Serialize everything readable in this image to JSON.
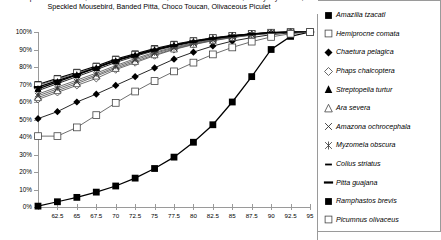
{
  "chart_data": {
    "type": "line",
    "title": "European Turtle-Dove, Chestnut-fronted Macaw, Yellow-crowned Parrot, Ebony Myzomela,\nSpeckled Mousebird, Banded Pitta, Choco Toucan, Olivaceous Piculet",
    "xlabel": "",
    "ylabel": "",
    "xlim": [
      60,
      95
    ],
    "ylim": [
      0,
      1
    ],
    "grid": false,
    "legend_position": "right",
    "x": [
      60,
      62.5,
      65,
      67.5,
      70,
      72.5,
      75,
      77.5,
      80,
      82.5,
      85,
      87.5,
      90,
      92.5,
      95
    ],
    "xtick_labels": [
      "62.5",
      "65",
      "67.5",
      "70",
      "72.5",
      "75",
      "77.5",
      "80",
      "82.5",
      "85",
      "87.5",
      "90",
      "92.5",
      "95"
    ],
    "xtick_values": [
      62.5,
      65,
      67.5,
      70,
      72.5,
      75,
      77.5,
      80,
      82.5,
      85,
      87.5,
      90,
      92.5,
      95
    ],
    "ytick_labels": [
      "0%",
      "10%",
      "20%",
      "30%",
      "40%",
      "50%",
      "60%",
      "70%",
      "80%",
      "90%",
      "100%"
    ],
    "ytick_values": [
      0,
      0.1,
      0.2,
      0.3,
      0.4,
      0.5,
      0.6,
      0.7,
      0.8,
      0.9,
      1.0
    ],
    "series": [
      {
        "name": "Amazilia tzacatl",
        "marker": "filled-square",
        "color": "#000000",
        "values": [
          0.7,
          0.735,
          0.77,
          0.805,
          0.845,
          0.875,
          0.905,
          0.93,
          0.95,
          0.967,
          0.98,
          0.99,
          0.997,
          1.0,
          1.0
        ]
      },
      {
        "name": "Hemiprocne comata",
        "marker": "open-square",
        "color": "#555555",
        "values": [
          0.695,
          0.73,
          0.765,
          0.8,
          0.84,
          0.87,
          0.9,
          0.925,
          0.947,
          0.965,
          0.978,
          0.989,
          0.996,
          1.0,
          1.0
        ]
      },
      {
        "name": "Chaetura pelagica",
        "marker": "filled-diamond",
        "color": "#000000",
        "values": [
          0.505,
          0.545,
          0.6,
          0.645,
          0.695,
          0.745,
          0.795,
          0.845,
          0.885,
          0.92,
          0.948,
          0.968,
          0.985,
          0.995,
          1.0
        ]
      },
      {
        "name": "Phaps chalcoptera",
        "marker": "open-diamond",
        "color": "#555555",
        "values": [
          0.615,
          0.655,
          0.695,
          0.735,
          0.785,
          0.825,
          0.865,
          0.9,
          0.928,
          0.95,
          0.968,
          0.982,
          0.992,
          0.998,
          1.0
        ]
      },
      {
        "name": "Streptopelia turtur",
        "marker": "filled-triangle",
        "color": "#000000",
        "values": [
          0.675,
          0.715,
          0.755,
          0.795,
          0.835,
          0.868,
          0.898,
          0.925,
          0.946,
          0.964,
          0.978,
          0.989,
          0.996,
          1.0,
          1.0
        ]
      },
      {
        "name": "Ara severa",
        "marker": "open-triangle",
        "color": "#555555",
        "values": [
          0.625,
          0.665,
          0.705,
          0.748,
          0.792,
          0.832,
          0.87,
          0.903,
          0.93,
          0.952,
          0.969,
          0.983,
          0.993,
          0.999,
          1.0
        ]
      },
      {
        "name": "Amazona ochrocephala",
        "marker": "cross-x",
        "color": "#555555",
        "values": [
          0.635,
          0.675,
          0.715,
          0.755,
          0.8,
          0.84,
          0.878,
          0.908,
          0.934,
          0.954,
          0.971,
          0.984,
          0.994,
          0.999,
          1.0
        ]
      },
      {
        "name": "Myzomela obscura",
        "marker": "asterisk",
        "color": "#555555",
        "values": [
          0.645,
          0.685,
          0.725,
          0.765,
          0.808,
          0.848,
          0.884,
          0.913,
          0.938,
          0.957,
          0.973,
          0.985,
          0.994,
          0.999,
          1.0
        ]
      },
      {
        "name": "Colius striatus",
        "marker": "short-dash",
        "color": "#000000",
        "values": [
          0.665,
          0.705,
          0.745,
          0.785,
          0.826,
          0.861,
          0.893,
          0.92,
          0.943,
          0.961,
          0.976,
          0.987,
          0.995,
          1.0,
          1.0
        ]
      },
      {
        "name": "Pitta guajana",
        "marker": "long-dash",
        "color": "#000000",
        "values": [
          0.685,
          0.722,
          0.758,
          0.796,
          0.838,
          0.869,
          0.899,
          0.924,
          0.946,
          0.964,
          0.977,
          0.988,
          0.996,
          1.0,
          1.0
        ]
      },
      {
        "name": "Ramphastos brevis",
        "marker": "filled-square",
        "color": "#000000",
        "values": [
          0.005,
          0.03,
          0.055,
          0.085,
          0.12,
          0.165,
          0.22,
          0.285,
          0.37,
          0.47,
          0.6,
          0.745,
          0.9,
          0.975,
          1.0
        ]
      },
      {
        "name": "Picumnus olivaceus",
        "marker": "open-square",
        "color": "#555555",
        "values": [
          0.405,
          0.405,
          0.455,
          0.525,
          0.595,
          0.66,
          0.72,
          0.775,
          0.825,
          0.872,
          0.912,
          0.945,
          0.972,
          0.99,
          1.0
        ]
      }
    ]
  },
  "legend": {
    "items": [
      {
        "label": "Amazilia tzacatl",
        "marker": "filled-square"
      },
      {
        "label": "Hemiprocne comata",
        "marker": "open-square"
      },
      {
        "label": "Chaetura pelagica",
        "marker": "filled-diamond"
      },
      {
        "label": "Phaps chalcoptera",
        "marker": "open-diamond"
      },
      {
        "label": "Streptopelia turtur",
        "marker": "filled-triangle"
      },
      {
        "label": "Ara severa",
        "marker": "open-triangle"
      },
      {
        "label": "Amazona ochrocephala",
        "marker": "cross-x"
      },
      {
        "label": "Myzomela obscura",
        "marker": "asterisk"
      },
      {
        "label": "Colius striatus",
        "marker": "short-dash"
      },
      {
        "label": "Pitta guajana",
        "marker": "long-dash"
      },
      {
        "label": "Ramphastos brevis",
        "marker": "filled-square"
      },
      {
        "label": "Picumnus olivaceus",
        "marker": "open-square"
      }
    ]
  },
  "colors": {
    "axis": "#9a9a9a",
    "text": "#000000",
    "series_dark": "#000000",
    "series_gray": "#555555",
    "background": "#ffffff"
  }
}
